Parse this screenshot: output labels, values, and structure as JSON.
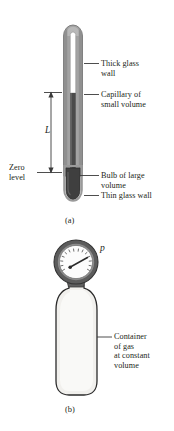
{
  "figure": {
    "title_parts": [
      "a",
      "b"
    ],
    "panel_a": {
      "caption": "(a)",
      "dimension_label": "L",
      "zero_label_line1": "Zero",
      "zero_label_line2": "level",
      "callouts": [
        {
          "name": "thick-glass-wall",
          "line1": "Thick glass",
          "line2": "wall"
        },
        {
          "name": "capillary",
          "line1": "Capillary of",
          "line2": "small volume"
        },
        {
          "name": "bulb",
          "line1": "Bulb of large",
          "line2": "volume"
        },
        {
          "name": "thin-glass-wall",
          "line1": "Thin glass wall",
          "line2": ""
        }
      ]
    },
    "panel_b": {
      "caption": "(b)",
      "pressure_symbol": "p",
      "container_label": [
        "Container",
        "of gas",
        "at constant",
        "volume"
      ]
    }
  },
  "colors": {
    "ink": "#231f20",
    "glass_wall": "#9a9a9a",
    "glass_wall_dark": "#6e6e6e",
    "capillary_fill": "#ffffff",
    "mercury": "#4a4a4a",
    "bulb": "#3f3f3f",
    "gauge_ring": "#595959",
    "gauge_face": "#fbfbfb",
    "container_fill": "#f0efec",
    "container_stroke": "#2b2b2b",
    "neck": "#6b6b6b"
  }
}
